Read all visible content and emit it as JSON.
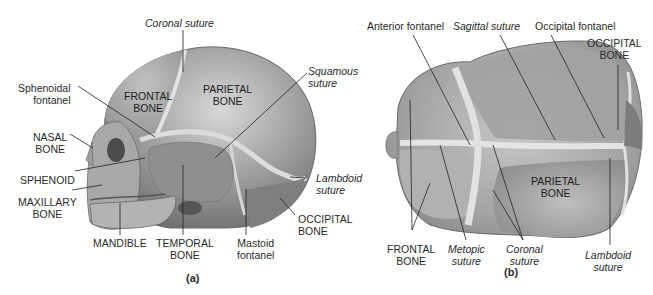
{
  "figure": {
    "panel_a": {
      "caption": "(a)",
      "view": "lateral",
      "labels": {
        "coronal_suture": "Coronal suture",
        "squamous_suture": "Squamous\nsuture",
        "sphenoidal_fontanel": "Sphenoidal\nfontanel",
        "frontal_bone": "FRONTAL\nBONE",
        "parietal_bone": "PARIETAL\nBONE",
        "nasal_bone": "NASAL\nBONE",
        "sphenoid": "SPHENOID",
        "maxillary_bone": "MAXILLARY\nBONE",
        "mandible": "MANDIBLE",
        "temporal_bone": "TEMPORAL\nBONE",
        "mastoid_fontanel": "Mastoid\nfontanel",
        "lambdoid_suture": "Lambdoid\nsuture",
        "occipital_bone": "OCCIPITAL\nBONE"
      }
    },
    "panel_b": {
      "caption": "(b)",
      "view": "superior",
      "labels": {
        "anterior_fontanel": "Anterior fontanel",
        "sagittal_suture": "Sagittal suture",
        "occipital_fontanel": "Occipital fontanel",
        "occipital_bone": "OCCIPITAL\nBONE",
        "parietal_bone": "PARIETAL\nBONE",
        "frontal_bone": "FRONTAL\nBONE",
        "metopic_suture": "Metopic\nsuture",
        "coronal_suture": "Coronal\nsuture",
        "lambdoid_suture": "Lambdoid\nsuture"
      }
    },
    "colors": {
      "bone_light": "#bdbdbd",
      "bone_mid": "#9a9a9a",
      "bone_dark": "#7a7a7a",
      "suture": "#e2e2e2",
      "leader_line": "#222222",
      "text": "#2a2a2a"
    }
  }
}
